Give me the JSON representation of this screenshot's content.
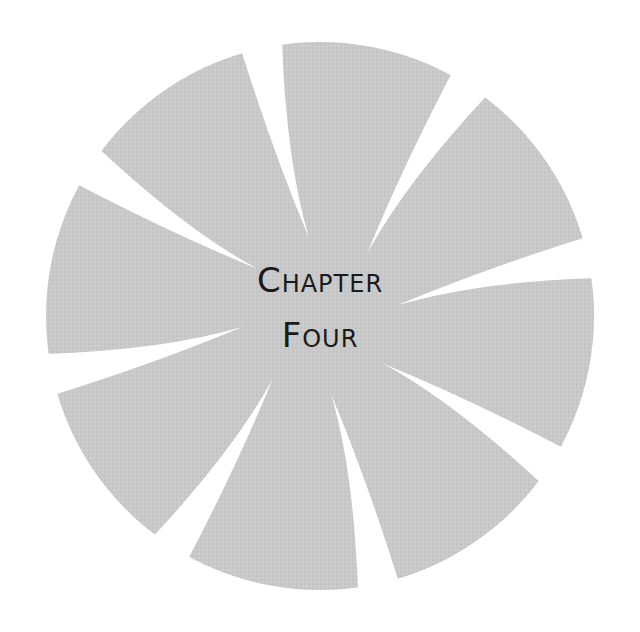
{
  "heading": {
    "line1": "Chapter",
    "line2": "Four"
  },
  "emblem": {
    "shape": "pinwheel-disc",
    "blade_count": 8,
    "fill_color": "#c9c9c9",
    "gap_color": "#ffffff"
  }
}
